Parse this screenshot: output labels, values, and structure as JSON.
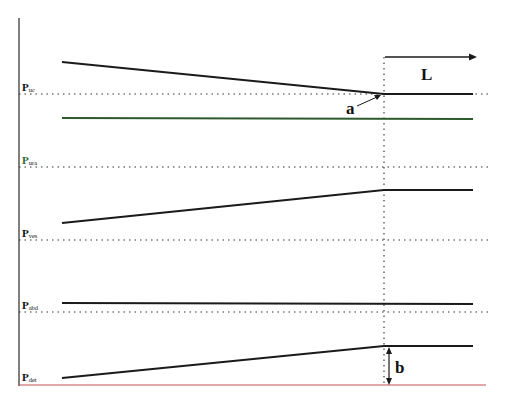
{
  "diagram": {
    "type": "pressure-flow schematic",
    "labels": {
      "ua": {
        "main": "P",
        "sub": "uc"
      },
      "ura": {
        "main": "P",
        "sub": "ura"
      },
      "ves": {
        "main": "P",
        "sub": "ves"
      },
      "abd": {
        "main": "P",
        "sub": "abd"
      },
      "det": {
        "main": "P",
        "sub": "det"
      }
    },
    "annotations": {
      "a": "a",
      "b": "b",
      "L": "L"
    },
    "colors": {
      "trace": "#1a1a1a",
      "urethral_trace": "#2d5a2d",
      "baseline": "#c0504d",
      "dotted": "#333333",
      "ura_label": "#2e6b2e"
    }
  }
}
